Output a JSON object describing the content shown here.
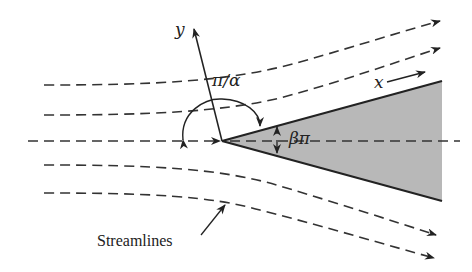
{
  "diagram": {
    "labels": {
      "y_axis": "y",
      "x_axis": "x",
      "angle_alpha": "π/α",
      "angle_beta": "βπ",
      "streamlines": "Streamlines"
    },
    "colors": {
      "line": "#222222",
      "wedge_fill": "#b8b8b8",
      "background": "#ffffff"
    },
    "elements": {
      "wedge": {
        "apex": [
          222,
          141
        ],
        "upper_end": [
          442,
          81
        ],
        "lower_end": [
          442,
          201
        ]
      },
      "streamline_count": 5
    }
  }
}
